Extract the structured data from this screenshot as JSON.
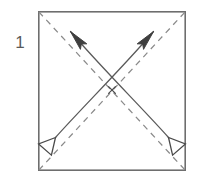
{
  "diagram": {
    "step_label": "1",
    "paper": {
      "shape": "square",
      "x": 38,
      "y": 11,
      "width": 148,
      "height": 160,
      "edge_color": "#6e6e6e",
      "fill_color": "#ffffff",
      "edge_width": 1.6
    },
    "center_mark": {
      "symbol": "x",
      "name": "center-cross-mark",
      "x": 112,
      "y": 90,
      "size": 7,
      "color": "#4a4a4a"
    },
    "creases": [
      {
        "name": "diagonal-crease-tl-br",
        "type": "valley-fold",
        "style": "dashed",
        "color": "#8a8a8a",
        "dash": "6 5",
        "x1": 38,
        "y1": 11,
        "x2": 186,
        "y2": 171
      },
      {
        "name": "diagonal-crease-bl-tr",
        "type": "valley-fold",
        "style": "dashed",
        "color": "#8a8a8a",
        "dash": "6 5",
        "x1": 38,
        "y1": 171,
        "x2": 186,
        "y2": 11
      }
    ],
    "arrows": [
      {
        "name": "fold-arrow-up-left",
        "direction": "bottom-right to top-left",
        "color": "#5a5a5a",
        "path": "M 171,140 C 150,118 96,66 67,28",
        "head_start": {
          "type": "hollow-triangle",
          "x": 171,
          "y": 140,
          "angle": 45
        },
        "head_end": {
          "type": "solid-slim",
          "x": 67,
          "y": 28,
          "angle": 232
        }
      },
      {
        "name": "fold-arrow-up-right",
        "direction": "bottom-left to top-right",
        "color": "#5a5a5a",
        "path": "M 53,140 C 74,118 128,66 157,28",
        "head_start": {
          "type": "hollow-triangle",
          "x": 53,
          "y": 140,
          "angle": 135
        },
        "head_end": {
          "type": "solid-slim",
          "x": 157,
          "y": 28,
          "angle": 308
        }
      }
    ],
    "colors": {
      "paper_edge": "#6e6e6e",
      "crease_line": "#8a8a8a",
      "arrow_line": "#5a5a5a",
      "label_text": "#5a5a5a",
      "background": "#ffffff"
    }
  }
}
